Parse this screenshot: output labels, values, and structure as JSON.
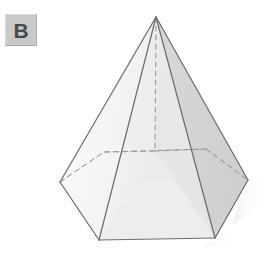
{
  "figure": {
    "label_badge": {
      "text": "B",
      "background_color": "#c9c9c9",
      "text_color": "#4a4a4a"
    },
    "shape_name": "hexagonal-pyramid",
    "background_color": "#ffffff",
    "edge_color": "#707070",
    "hidden_edge_color": "#9a9a9a",
    "face_colors": {
      "front_left": "#f2f2f2",
      "front_center": "#e6e6e6",
      "front_right": "#dcdcdc",
      "far_left": "#f7f7f7",
      "far_right": "#d4d4d4",
      "base_left": "#ececec",
      "base_right": "#e0e0e0"
    },
    "shadow_color": "#ededed",
    "geometry": {
      "apex": [
        156,
        17
      ],
      "base_vertices": {
        "left": [
          60,
          182
        ],
        "bottom_left": [
          99,
          240
        ],
        "bottom_right": [
          215,
          238
        ],
        "right": [
          248,
          180
        ],
        "back_right": [
          206,
          149
        ],
        "back_left": [
          104,
          152
        ]
      },
      "base_center": [
        155,
        151
      ]
    }
  }
}
